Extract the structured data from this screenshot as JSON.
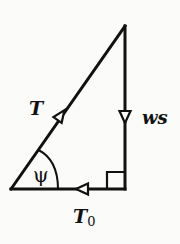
{
  "diagram": {
    "type": "force-triangle",
    "colors": {
      "background": "#fbfbf9",
      "stroke": "#111111"
    },
    "vertices": {
      "bottom_left": [
        11,
        189
      ],
      "bottom_right": [
        125,
        189
      ],
      "top": [
        125,
        26
      ]
    },
    "labels": {
      "hypotenuse": "T",
      "vertical": "ws",
      "horizontal_main": "T",
      "horizontal_sub": "0",
      "angle": "ψ"
    },
    "arrows": {
      "hypotenuse": "up-right",
      "vertical": "down",
      "horizontal": "left"
    },
    "right_angle_marker": true
  }
}
